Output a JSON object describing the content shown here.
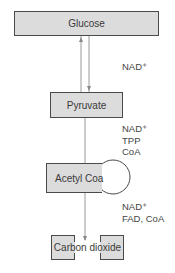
{
  "diagram": {
    "nodes": [
      {
        "id": "glucose",
        "label": "Glucose"
      },
      {
        "id": "pyruvate",
        "label": "Pyruvate"
      },
      {
        "id": "acetyl_coa",
        "label": "Acetyl Coa"
      },
      {
        "id": "carbon_dioxide",
        "label": "Carbon dioxide"
      }
    ],
    "edges": [
      {
        "from": "glucose",
        "to": "pyruvate",
        "bidirectional": true,
        "cofactors": [
          "NAD+"
        ]
      },
      {
        "from": "pyruvate",
        "to": "acetyl_coa",
        "cofactors": [
          "NAD+",
          "TPP",
          "CoA"
        ]
      },
      {
        "from": "acetyl_coa",
        "to": "carbon_dioxide",
        "cofactors": [
          "NAD+",
          "FAD, CoA"
        ]
      }
    ]
  },
  "labels": {
    "step1": {
      "line1": "NAD⁺"
    },
    "step2": {
      "line1": "NAD⁺",
      "line2": "TPP",
      "line3": "CoA"
    },
    "step3": {
      "line1": "NAD⁺",
      "line2": "FAD, CoA"
    }
  },
  "colors": {
    "box_fill": "#dcdcdc",
    "box_border": "#4a4a4a",
    "connector": "#9a9a9a"
  }
}
